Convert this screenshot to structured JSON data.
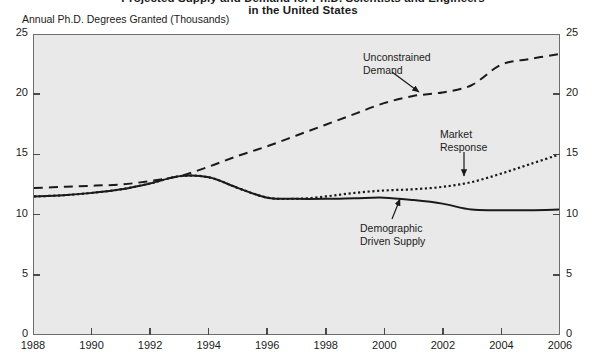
{
  "title": {
    "line1": "Projected Supply and Demand for Ph.D. Scientists and Engineers",
    "line2": "in the United States"
  },
  "axes": {
    "ylabel": "Annual Ph.D. Degrees Granted (Thousands)",
    "y_ticks": [
      "0",
      "5",
      "10",
      "15",
      "20",
      "25"
    ],
    "y_ticks_right": [
      "0",
      "5",
      "10",
      "15",
      "20",
      "25"
    ],
    "x_ticks": [
      "1988",
      "1990",
      "1992",
      "1994",
      "1996",
      "1998",
      "2000",
      "2002",
      "2004",
      "2006"
    ]
  },
  "annotations": {
    "unconstrained": {
      "line1": "Unconstrained",
      "line2": "Demand"
    },
    "market": {
      "line1": "Market",
      "line2": "Response"
    },
    "demographic": {
      "line1": "Demographic",
      "line2": "Driven Supply"
    }
  },
  "colors": {
    "plot_background": "#e9e9e9",
    "frame": "#6d6d6d",
    "series": "#1a1a1a"
  },
  "chart_data": {
    "type": "line",
    "title": "Projected Supply and Demand for Ph.D. Scientists and Engineers in the United States",
    "xlabel": "",
    "ylabel": "Annual Ph.D. Degrees Granted (Thousands)",
    "xlim": [
      1988,
      2006
    ],
    "ylim": [
      0,
      25
    ],
    "grid": false,
    "legend": "annotations-inline",
    "x": [
      1988,
      1989,
      1990,
      1991,
      1992,
      1993,
      1994,
      1995,
      1996,
      1997,
      1998,
      1999,
      2000,
      2001,
      2002,
      2003,
      2004,
      2005,
      2006
    ],
    "series": [
      {
        "name": "Unconstrained Demand",
        "style": "dashed",
        "values": [
          12.2,
          12.3,
          12.4,
          12.5,
          12.8,
          13.2,
          14.0,
          14.9,
          15.7,
          16.6,
          17.5,
          18.4,
          19.3,
          19.9,
          20.2,
          20.8,
          22.5,
          23.0,
          23.4
        ]
      },
      {
        "name": "Market Response",
        "style": "dotted",
        "values": [
          11.5,
          11.6,
          11.8,
          12.1,
          12.6,
          13.2,
          13.1,
          12.2,
          11.4,
          11.3,
          11.5,
          11.8,
          12.0,
          12.1,
          12.3,
          12.7,
          13.4,
          14.2,
          15.0
        ]
      },
      {
        "name": "Demographic Driven Supply",
        "style": "solid",
        "values": [
          11.5,
          11.6,
          11.8,
          12.1,
          12.6,
          13.2,
          13.1,
          12.2,
          11.4,
          11.3,
          11.3,
          11.35,
          11.4,
          11.2,
          10.9,
          10.4,
          10.35,
          10.35,
          10.4
        ]
      }
    ]
  }
}
